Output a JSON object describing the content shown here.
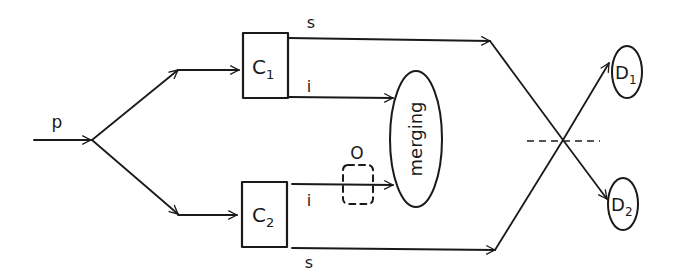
{
  "diagram": {
    "input": {
      "label": "p"
    },
    "crystals": [
      {
        "id": "C1",
        "main": "C",
        "sub": "1"
      },
      {
        "id": "C2",
        "main": "C",
        "sub": "2"
      }
    ],
    "signal_top_label": "s",
    "idler_top_label": "i",
    "idler_bottom_label": "i",
    "signal_bottom_label": "s",
    "object_label": "O",
    "merging_label": "merging",
    "detectors": [
      {
        "id": "D1",
        "main": "D",
        "sub": "1"
      },
      {
        "id": "D2",
        "main": "D",
        "sub": "2"
      }
    ],
    "colors": {
      "line": "#1a1a1a",
      "background": "#ffffff"
    }
  }
}
